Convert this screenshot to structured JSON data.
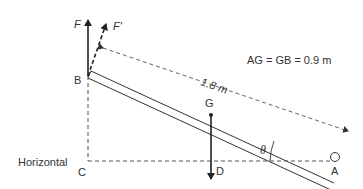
{
  "diagram": {
    "type": "inclined beam statics",
    "labels": {
      "force_F": "F",
      "force_F_prime": "F'",
      "point_B": "B",
      "point_G": "G",
      "point_C": "C",
      "point_D": "D",
      "point_A": "A",
      "angle": "θ",
      "horizontal": "Horizontal",
      "length": "1.8 m",
      "equation": "AG = GB = 0.9 m"
    },
    "colors": {
      "line": "#333333",
      "dashed": "#555555",
      "text": "#333333"
    }
  }
}
